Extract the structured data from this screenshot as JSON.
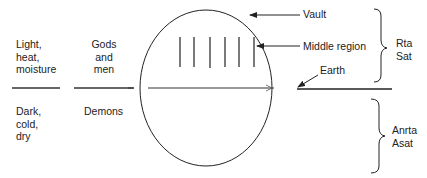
{
  "diagram": {
    "left_upper": "Light,\nheat,\nmoisture",
    "left_lower": "Dark,\ncold,\ndry",
    "mid_upper": "Gods\nand\nmen",
    "mid_lower": "Demons",
    "vault": "Vault",
    "middle_region": "Middle region",
    "earth": "Earth",
    "upper_brace": "Rta\nSat",
    "lower_brace": "Anrta\nAsat",
    "line_color": "#222222"
  }
}
